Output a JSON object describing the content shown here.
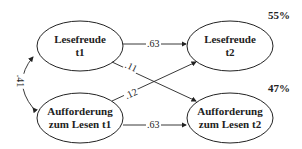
{
  "nodes": {
    "lesefreude_t1": {
      "line1": "Lesefreude",
      "line2": "t1"
    },
    "lesefreude_t2": {
      "line1": "Lesefreude",
      "line2": "t2",
      "r2": "55%"
    },
    "aufforderung_t1": {
      "line1": "Aufforderung",
      "line2": "zum Lesen t1"
    },
    "aufforderung_t2": {
      "line1": "Aufforderung",
      "line2": "zum Lesen t2",
      "r2": "47%"
    }
  },
  "paths": {
    "lf1_lf2": ".63",
    "lf1_af2": ".11",
    "af1_lf2": ".12",
    "af1_af2": ".63",
    "correlation_t1": ".41"
  },
  "colors": {
    "line": "#222222",
    "background": "#ffffff"
  }
}
